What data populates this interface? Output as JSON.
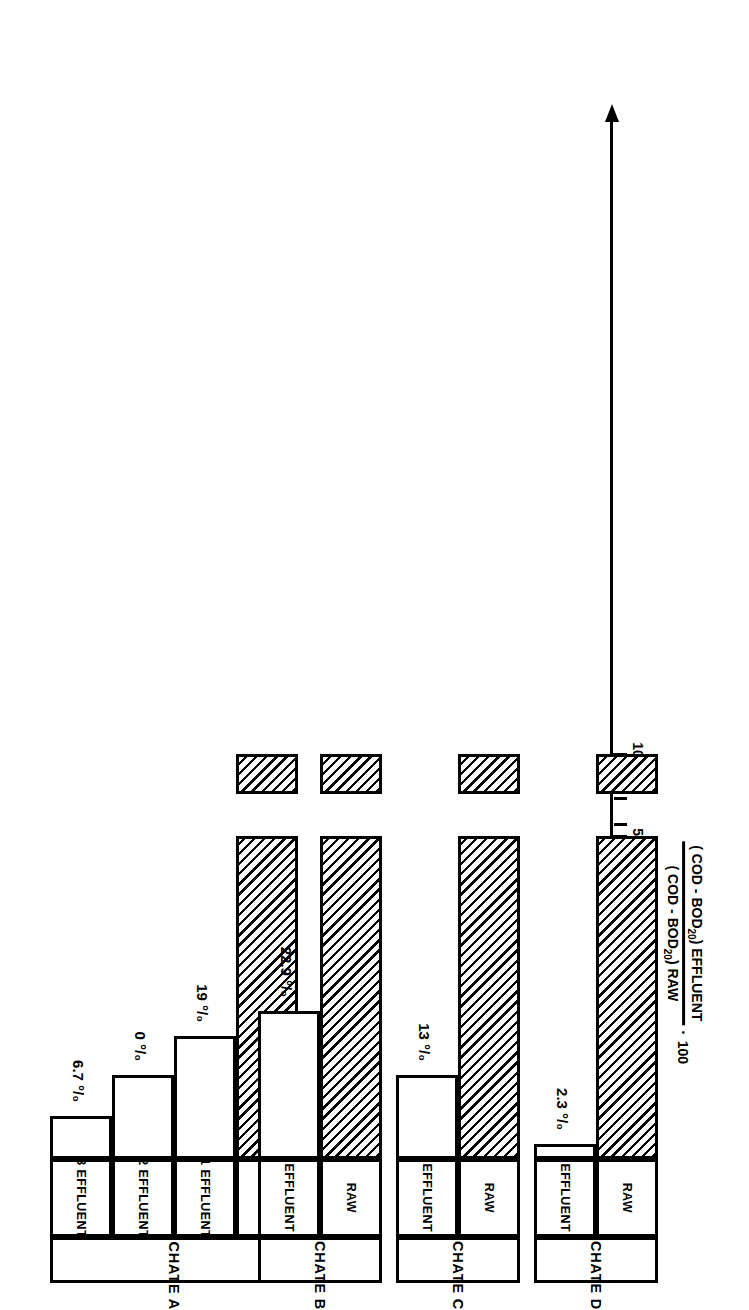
{
  "figure": {
    "orientation_note": "landscape bar chart rendered rotated 90deg on a portrait page",
    "axis_title": {
      "numerator_pre": "( COD - BOD",
      "numerator_sub": "20",
      "numerator_post": ") EFFLUENT",
      "denominator_pre": "( COD - BOD",
      "denominator_sub": "20",
      "denominator_post": ") RAW",
      "multiplier_dot": "·",
      "multiplier": "100"
    },
    "axis": {
      "tick_labels": [
        "100",
        "50",
        "40",
        "30",
        "20",
        "10",
        "0"
      ],
      "tick_values": [
        100,
        50,
        40,
        30,
        20,
        10,
        0
      ],
      "break_between": [
        "100",
        "50"
      ],
      "arrow": "arrow-head-icon"
    },
    "groups": [
      {
        "name": "LEACHATE A",
        "bars": [
          {
            "series": "RAW",
            "value": 100,
            "label": "",
            "hatched": true
          },
          {
            "series": "1 EFFLUENT",
            "value": 19,
            "label": "19 °/₀",
            "hatched": false
          },
          {
            "series": "2 EFFLUENT",
            "value": 13,
            "label": "0 °/₀",
            "hatched": false
          },
          {
            "series": "3 EFFLUENT",
            "value": 6.7,
            "label": "6.7 °/₀",
            "hatched": false
          }
        ]
      },
      {
        "name": "LEACHATE B",
        "bars": [
          {
            "series": "RAW",
            "value": 100,
            "label": "",
            "hatched": true
          },
          {
            "series": "EFFLUENT",
            "value": 22.9,
            "label": "22.9 °/₀",
            "hatched": false
          }
        ]
      },
      {
        "name": "LEACHATE C",
        "bars": [
          {
            "series": "RAW",
            "value": 100,
            "label": "",
            "hatched": true
          },
          {
            "series": "EFFLUENT",
            "value": 13,
            "label": "13 °/₀",
            "hatched": false
          }
        ]
      },
      {
        "name": "LEACHATE D",
        "bars": [
          {
            "series": "RAW",
            "value": 100,
            "label": "",
            "hatched": true
          },
          {
            "series": "EFFLUENT",
            "value": 2.3,
            "label": "2.3 °/₀",
            "hatched": false
          }
        ]
      }
    ]
  },
  "chart_data": {
    "type": "bar",
    "orientation": "horizontal",
    "title": "",
    "xlabel": "( COD - BOD20 ) EFFLUENT / ( COD - BOD20 ) RAW · 100",
    "ylabel": "",
    "xlim": [
      0,
      100
    ],
    "axis_break": {
      "between": [
        50,
        100
      ],
      "note": "axis broken between 50 and 100"
    },
    "xticks": [
      0,
      10,
      20,
      30,
      40,
      50,
      100
    ],
    "xtick_labels": [
      "0",
      "10",
      "20",
      "30",
      "40",
      "50",
      "100"
    ],
    "grid": false,
    "legend": "none",
    "hatch_note": "RAW bars are hatched (45 degree diagonal), EFFLUENT bars are unfilled",
    "categories": [
      "LEACHATE A",
      "LEACHATE B",
      "LEACHATE C",
      "LEACHATE D"
    ],
    "groups": [
      {
        "category": "LEACHATE A",
        "bars": [
          {
            "label": "RAW",
            "value": 100,
            "annotation": ""
          },
          {
            "label": "1 EFFLUENT",
            "value": 19,
            "annotation": "19 %"
          },
          {
            "label": "2 EFFLUENT",
            "value": 13,
            "annotation": "0 %"
          },
          {
            "label": "3 EFFLUENT",
            "value": 6.7,
            "annotation": "6.7 %"
          }
        ]
      },
      {
        "category": "LEACHATE B",
        "bars": [
          {
            "label": "RAW",
            "value": 100,
            "annotation": ""
          },
          {
            "label": "EFFLUENT",
            "value": 22.9,
            "annotation": "22.9 %"
          }
        ]
      },
      {
        "category": "LEACHATE C",
        "bars": [
          {
            "label": "RAW",
            "value": 100,
            "annotation": ""
          },
          {
            "label": "EFFLUENT",
            "value": 13,
            "annotation": "13 %"
          }
        ]
      },
      {
        "category": "LEACHATE D",
        "bars": [
          {
            "label": "RAW",
            "value": 100,
            "annotation": ""
          },
          {
            "label": "EFFLUENT",
            "value": 2.3,
            "annotation": "2.3 %"
          }
        ]
      }
    ],
    "colors": {
      "ink": "#000000",
      "background": "#ffffff"
    }
  }
}
